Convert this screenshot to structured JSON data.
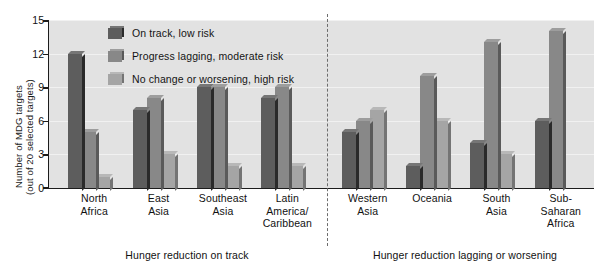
{
  "chart_data": {
    "type": "bar",
    "title": "",
    "xlabel": "",
    "ylabel_line1": "Number of MDG targets",
    "ylabel_line2": "(out of 20 selected targets)",
    "ylim": [
      0,
      15
    ],
    "yticks": [
      0,
      3,
      6,
      9,
      12,
      15
    ],
    "grid": true,
    "legend_position": "inside-top-left",
    "categories": [
      "North Africa",
      "East Asia",
      "Southeast Asia",
      "Latin America/ Caribbean",
      "Western Asia",
      "Oceania",
      "South Asia",
      "Sub-Saharan Africa"
    ],
    "category_label_lines": [
      [
        "North",
        "Africa"
      ],
      [
        "East",
        "Asia"
      ],
      [
        "Southeast",
        "Asia"
      ],
      [
        "Latin",
        "America/",
        "Caribbean"
      ],
      [
        "Western",
        "Asia"
      ],
      [
        "Oceania"
      ],
      [
        "South",
        "Asia"
      ],
      [
        "Sub-",
        "Saharan",
        "Africa"
      ]
    ],
    "series": [
      {
        "name": "On track, low risk",
        "color": "#5d5d5d",
        "values": [
          12,
          7,
          9,
          8,
          5,
          2,
          4,
          6
        ]
      },
      {
        "name": "Progress lagging, moderate risk",
        "color": "#888888",
        "values": [
          5,
          8,
          9,
          9,
          6,
          10,
          13,
          14
        ]
      },
      {
        "name": "No change or worsening, high risk",
        "color": "#a5a5a5",
        "values": [
          1,
          3,
          2,
          2,
          7,
          6,
          3,
          0
        ]
      }
    ],
    "group_captions": [
      "Hunger reduction on track",
      "Hunger reduction lagging or worsening"
    ],
    "divider": {
      "after_category_index": 3,
      "style": "dashed"
    }
  },
  "ytick_labels": {
    "t0": "0",
    "t3": "3",
    "t6": "6",
    "t9": "9",
    "t12": "12",
    "t15": "15"
  },
  "legend": {
    "items": [
      "On track, low risk",
      "Progress lagging, moderate risk",
      "No change or worsening, high risk"
    ]
  },
  "captions": {
    "left": "Hunger reduction on track",
    "right": "Hunger reduction lagging or worsening"
  }
}
